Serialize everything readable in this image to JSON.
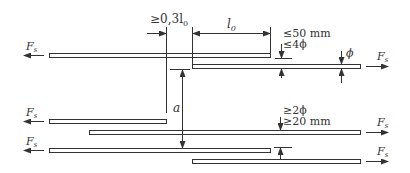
{
  "diagram": {
    "force_label": "F",
    "force_subscript": "s",
    "labels": {
      "offset": "≥0,3l",
      "offset_sub": "0",
      "lap_length": "l",
      "lap_length_sub": "0",
      "clear_gap_1": "≤50 mm",
      "clear_gap_2": "≤4ϕ",
      "diameter": "ϕ",
      "spacing": "a",
      "min_spacing_1": "≥2ϕ",
      "min_spacing_2": "≥20 mm"
    },
    "colors": {
      "line": "#333333",
      "bar_fill": "#ffffff",
      "background": "#ffffff"
    }
  }
}
